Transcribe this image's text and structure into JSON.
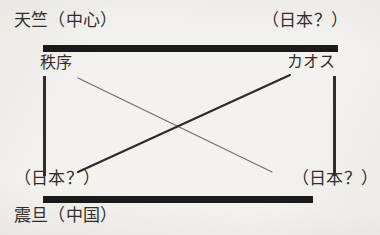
{
  "diagram": {
    "type": "axis-quadrant-schematic",
    "background_color": "#f4f2ee",
    "ink_color": "#2b2b2b",
    "corner_labels": {
      "top_left": "天竺（中心）",
      "top_right": "（日本？）",
      "bottom_left": "（日本？）",
      "bottom_right": "（日本？）"
    },
    "axis_labels": {
      "left_inner": "秩序",
      "right_inner": "カオス"
    },
    "outer_labels": {
      "bottom_left_outer": "震旦（中国）"
    },
    "frame": {
      "top_rule": {
        "x": 43,
        "y": 45,
        "width": 295,
        "height": 7,
        "color": "#1a1a1a"
      },
      "bottom_rule": {
        "x": 43,
        "y": 196,
        "width": 270,
        "height": 7,
        "color": "#1a1a1a"
      },
      "left_rule": {
        "x": 43,
        "y": 76,
        "width": 3,
        "height": 100,
        "color": "#2e2e2e"
      },
      "right_rule": {
        "x": 333,
        "y": 76,
        "width": 3,
        "height": 100,
        "color": "#2e2e2e"
      }
    },
    "connectors": [
      {
        "name": "order-to-chaos-descending",
        "from": [
          78,
          78
        ],
        "to": [
          272,
          172
        ],
        "stroke": "#6e6e6e",
        "stroke_width": 1.2
      },
      {
        "name": "chaos-to-order-ascending",
        "from": [
          78,
          172
        ],
        "to": [
          290,
          75
        ],
        "stroke": "#2a2a2a",
        "stroke_width": 2.1
      }
    ],
    "crossing_point": [
      180,
      122
    ]
  }
}
